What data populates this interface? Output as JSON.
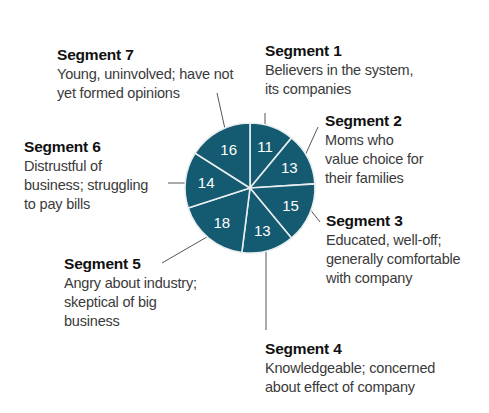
{
  "chart_data": {
    "type": "pie",
    "title": "",
    "unit": "percent",
    "start_angle_deg": 0,
    "direction": "clockwise",
    "color": "#145a70",
    "slices": [
      {
        "name": "Segment 1",
        "value": 11,
        "description": "Believers in the system, its companies"
      },
      {
        "name": "Segment 2",
        "value": 13,
        "description": "Moms who value choice for their families"
      },
      {
        "name": "Segment 3",
        "value": 15,
        "description": "Educated, well-off; generally comfortable with company"
      },
      {
        "name": "Segment 4",
        "value": 13,
        "description": "Knowledgeable; concerned about effect of company"
      },
      {
        "name": "Segment 5",
        "value": 18,
        "description": "Angry about industry; skeptical of big business"
      },
      {
        "name": "Segment 6",
        "value": 14,
        "description": "Distrustful of business; struggling to pay bills"
      },
      {
        "name": "Segment 7",
        "value": 16,
        "description": "Young, uninvolved; have not yet formed opinions"
      }
    ]
  },
  "labels": [
    {
      "title": "Segment 1",
      "desc": "Believers in the system,\nits companies"
    },
    {
      "title": "Segment 2",
      "desc": "Moms who\nvalue choice for\ntheir families"
    },
    {
      "title": "Segment 3",
      "desc": "Educated, well-off;\ngenerally comfortable\nwith company"
    },
    {
      "title": "Segment 4",
      "desc": "Knowledgeable; concerned\nabout effect of company"
    },
    {
      "title": "Segment 5",
      "desc": "Angry about industry;\nskeptical of big\nbusiness"
    },
    {
      "title": "Segment 6",
      "desc": "Distrustful of\nbusiness; struggling\nto pay bills"
    },
    {
      "title": "Segment 7",
      "desc": "Young, uninvolved; have not\nyet formed opinions"
    }
  ]
}
